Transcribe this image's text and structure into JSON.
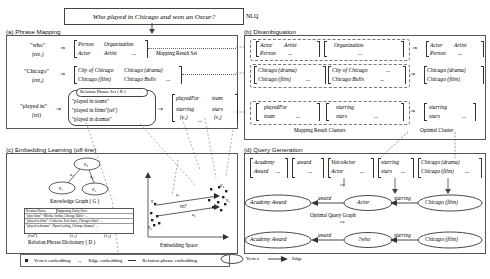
{
  "figure": {
    "nlq": {
      "text": "Who played in Chicago and won an Oscar?",
      "tag": "NLQ"
    },
    "legend_bottom": {
      "vertex_embedding": "Vertex embedding",
      "edge_embedding": "Edge embedding",
      "relation_phrase_embedding": "Relation phrase embedding"
    }
  },
  "panel_a": {
    "title": "(a) Phrase Mapping",
    "mapping_result_set_label": "Mapping Result Set",
    "rows": [
      {
        "phrase": "\"who\"",
        "var": "(ent₁)",
        "candidates": [
          "Person",
          "Organization",
          "Actor",
          "Artist",
          "..."
        ]
      },
      {
        "phrase": "\"Chicago\"",
        "var": "(ent₂)",
        "candidates": [
          "City of Chicago",
          "Chicago (drama)",
          "Chicago (film)",
          "Chicago Bulls",
          "..."
        ]
      },
      {
        "phrase": "\"played in\"",
        "var": "(rel)",
        "candidates": [
          "playedFor",
          "team",
          "starring",
          "stars",
          "..."
        ],
        "v1": "(v₁)",
        "v2": "(v₂)"
      }
    ],
    "relation_phrase_set": {
      "title": "Relation Phrase Set ( R )",
      "items": [
        "\"played in teams\"",
        "\"played in films\"(rel')",
        "\"played in dramas\""
      ]
    }
  },
  "panel_b": {
    "title": "(b) Disambiguation",
    "clusters_label": "Mapping Result Clusters",
    "optimal_label": "Optimal Cluster",
    "rows": [
      {
        "groups": [
          [
            "Actor",
            "Artist",
            "Person",
            "..."
          ],
          [
            "Organization",
            "..."
          ]
        ],
        "optimal": [
          "Actor",
          "Artist",
          "Person",
          "..."
        ]
      },
      {
        "groups": [
          [
            "Chicago (drama)",
            "Chicago (film)",
            "..."
          ],
          [
            "City of Chicago",
            "...",
            "Chicago Bulls",
            "..."
          ]
        ],
        "optimal": [
          "Chicago (drama)",
          "Chicago (film)",
          "..."
        ]
      },
      {
        "groups": [
          [
            "playedFor",
            "team",
            "..."
          ],
          [
            "starring",
            "stars",
            "..."
          ]
        ],
        "optimal": [
          "starring",
          "stars",
          "..."
        ]
      }
    ]
  },
  "panel_c": {
    "title": "(c) Embedding Learning (off-line)",
    "knowledge_graph_label": "Knowledge Graph ( G )",
    "kg_vertices": [
      "v₃",
      "v₁",
      "v₂"
    ],
    "kg_edges": [
      "e₁",
      "e₂"
    ],
    "dictionary_label": "Relation Phrase Dictionary ( D )",
    "dictionary_headers": [
      "Relation Phrase",
      "Supporting Entity Pairs"
    ],
    "dictionary_rows": [
      "\"play films\"  <Michae Jordan, Chicago Bulls> ...",
      "\"played in films\"  <Catherine Zeta-Jones, Chicago (film)> ...",
      "\"played in dramas\"  <Ryan Gosling, Chicago (drama)> ..."
    ],
    "dict_labels": [
      "(rel')",
      "(v₁)",
      "(v₂)"
    ],
    "embedding_space_label": "Embedding Space",
    "embedding_points": [
      "v₁",
      "v₂",
      "v₃",
      "v₄"
    ],
    "embedding_edges": [
      "e₁",
      "e₂"
    ],
    "embedding_relation": "rel'"
  },
  "panel_d": {
    "title": "(d) Query Generation",
    "optimal_query_graph_label": "Optimal Query Graph",
    "candidate_columns": [
      [
        "Academy",
        "Award",
        "..."
      ],
      [
        "award",
        "..."
      ],
      [
        "VoiceActor",
        "Actor",
        "..."
      ],
      [
        "starring",
        "stars",
        "..."
      ],
      [
        "Chicago (drama)",
        "Chicago (film)",
        "..."
      ]
    ],
    "graph_top": {
      "left_vertex": "Academy Award",
      "middle_vertex": "Actor",
      "right_vertex": "Chicago (film)",
      "left_edge": "award",
      "right_edge": "starring"
    },
    "graph_bottom": {
      "left_vertex": "Academy Award",
      "middle_vertex": "?who",
      "right_vertex": "Chicago (film)",
      "left_edge": "award",
      "right_edge": "starring"
    },
    "legend": {
      "vertex": "Vertex",
      "edge": "Edge"
    }
  }
}
